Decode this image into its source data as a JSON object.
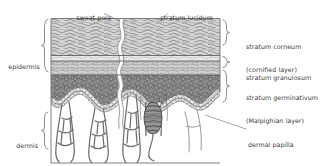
{
  "diagram": {
    "type": "anatomical-cross-section",
    "palette": {
      "ink": "#4a4a4a",
      "line": "#555555",
      "label_text": "#3a3a3a",
      "background": "#ffffff",
      "stratum_corneum_fill": "#d2d2d2",
      "stratum_granulosum_fill": "#c9c9c9",
      "stratum_germinativum_fill": "#8e8e8e",
      "dermis_fill": "#ffffff",
      "basal_cell_fill": "#e3e3e3",
      "sweat_gland_fill": "#a0a0a0",
      "sweat_duct_fill": "#fbfbfb"
    },
    "labels_left": [
      {
        "name": "epidermis",
        "text": "epidermis"
      },
      {
        "name": "dermis",
        "text": "dermis"
      }
    ],
    "labels_top": [
      {
        "name": "sweat-pore",
        "text": "sweat pore"
      },
      {
        "name": "stratum-lucidum",
        "text": "stratum lucidum"
      }
    ],
    "labels_right": [
      {
        "name": "stratum-corneum",
        "line1": "stratum corneum",
        "line2": "(cornified layer)"
      },
      {
        "name": "stratum-granulosum",
        "line1": "stratum granulosum",
        "line2": ""
      },
      {
        "name": "stratum-germinativum",
        "line1": "stratum germinativum",
        "line2": "(Malpighian layer)"
      },
      {
        "name": "dermal-papilla",
        "line1": "dermal papilla",
        "line2": ""
      }
    ],
    "layers": [
      {
        "name": "stratum corneum",
        "region": "epidermis",
        "texture": "flaky-horizontal-scales"
      },
      {
        "name": "stratum lucidum",
        "region": "epidermis",
        "texture": "thin-clear-band"
      },
      {
        "name": "stratum granulosum",
        "region": "epidermis",
        "texture": "fine-granular"
      },
      {
        "name": "stratum germinativum",
        "region": "epidermis",
        "texture": "dense-polygonal-cells"
      },
      {
        "name": "dermis",
        "region": "dermis",
        "texture": "open-connective-tissue-with-capillary-loops"
      }
    ],
    "structures": [
      {
        "name": "sweat pore",
        "description": "wavy duct opening at skin surface"
      },
      {
        "name": "sweat duct",
        "description": "coiled duct descending through epidermis"
      },
      {
        "name": "sweat gland",
        "description": "coiled glandular body in dermis"
      },
      {
        "name": "dermal papilla",
        "description": "upward projection of dermis into epidermis"
      },
      {
        "name": "capillary loop",
        "description": "vascular loops within dermal papillae"
      }
    ]
  }
}
